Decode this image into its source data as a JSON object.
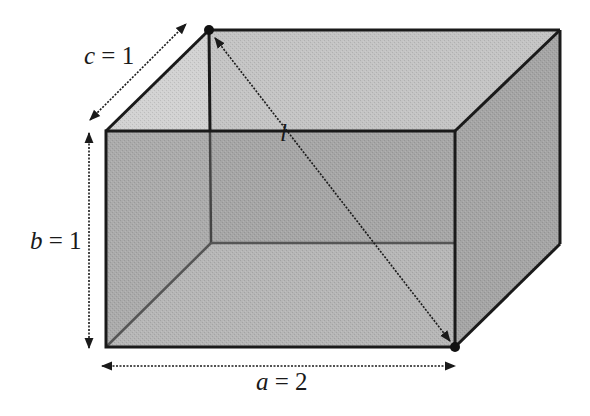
{
  "figure": {
    "type": "rectangular-box-diagonal",
    "colors": {
      "background": "#ffffff",
      "front_face": "#ababab",
      "top_face": "#c4c4c4",
      "top_left_triangle": "#d2d2d2",
      "right_face": "#a3a3a3",
      "edge": "#1a1a1a",
      "hidden_edge": "#555555"
    },
    "labels": {
      "c": {
        "var": "c",
        "eq": " = ",
        "val": "1"
      },
      "b": {
        "var": "b",
        "eq": " = ",
        "val": "1"
      },
      "a": {
        "var": "a",
        "eq": " = ",
        "val": "2"
      },
      "l": {
        "var": "l"
      }
    },
    "dimensions": {
      "a": 2,
      "b": 1,
      "c": 1
    },
    "diagonal": {
      "name": "l",
      "from": "back-top-left vertex",
      "to": "front-bottom-right vertex"
    }
  }
}
